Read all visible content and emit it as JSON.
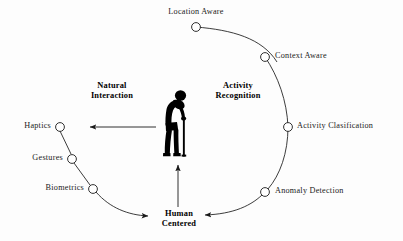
{
  "diagram": {
    "background_color": "#fdfdfd",
    "stroke_color": "#1a1a1a",
    "node_fill_color": "#ffffff",
    "figure_color": "#000000",
    "hub": {
      "line1": "Human",
      "line2": "Centered"
    },
    "groups": [
      {
        "id": "natural-interaction",
        "line1": "Natural",
        "line2": "Interaction"
      },
      {
        "id": "activity-recognition",
        "line1": "Activity",
        "line2": "Recognition"
      }
    ],
    "right_branch": {
      "name": "activity-recognition",
      "nodes": [
        {
          "id": "location-aware",
          "label": "Location Aware",
          "cx": 196,
          "cy": 27,
          "label_x": 196,
          "label_y": 8,
          "align": "center"
        },
        {
          "id": "context-aware",
          "label": "Context Aware",
          "cx": 265,
          "cy": 57,
          "label_x": 275,
          "label_y": 53,
          "align": "left"
        },
        {
          "id": "activity-clasification",
          "label": "Activity Clasification",
          "cx": 288,
          "cy": 127,
          "label_x": 298,
          "label_y": 123,
          "align": "left"
        },
        {
          "id": "anomaly-detection",
          "label": "Anomaly Detection",
          "cx": 265,
          "cy": 192,
          "label_x": 275,
          "label_y": 188,
          "align": "left"
        }
      ]
    },
    "left_branch": {
      "name": "natural-interaction",
      "nodes": [
        {
          "id": "haptics",
          "label": "Haptics",
          "cx": 60,
          "cy": 127,
          "label_x": 50,
          "label_y": 123,
          "align": "right"
        },
        {
          "id": "gestures",
          "label": "Gestures",
          "cx": 72,
          "cy": 159,
          "label_x": 62,
          "label_y": 155,
          "align": "right"
        },
        {
          "id": "biometrics",
          "label": "Biometrics",
          "cx": 93,
          "cy": 189,
          "label_x": 83,
          "label_y": 185,
          "align": "right"
        }
      ]
    },
    "center_figure": {
      "id": "elderly-person-with-cane",
      "description": "Silhouette of a hunched elderly person walking with a cane"
    },
    "arrows": [
      {
        "id": "to-natural-interaction",
        "direction": "left",
        "from_x": 156,
        "from_y": 127,
        "to_x": 88,
        "to_y": 127
      },
      {
        "id": "hub-to-figure",
        "direction": "up",
        "from_x": 178,
        "from_y": 207,
        "to_x": 178,
        "to_y": 163
      },
      {
        "id": "left-chain-to-hub",
        "direction": "right"
      },
      {
        "id": "right-arc-to-hub",
        "direction": "left"
      }
    ]
  }
}
